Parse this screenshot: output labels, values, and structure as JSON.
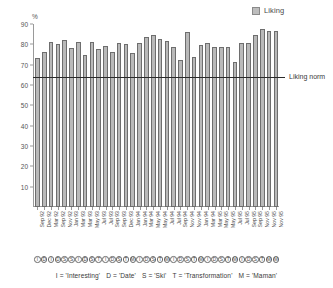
{
  "legend": {
    "items": [
      {
        "label": "Liking",
        "color": "#b9b9b9"
      }
    ]
  },
  "axis": {
    "unit_label": "%",
    "y_ticks": [
      "90",
      "80",
      "70",
      "60",
      "50",
      "40",
      "30",
      "20",
      "10"
    ]
  },
  "norm": {
    "label": "Liking norm",
    "value": 64
  },
  "footnote": {
    "items": [
      "I = 'Interesting'",
      "D = 'Date'",
      "S = 'Ski'",
      "T = 'Transformation'",
      "M = 'Maman'"
    ]
  },
  "chart_data": {
    "type": "bar",
    "title": "",
    "subtitle": "",
    "xlabel": "",
    "ylabel": "%",
    "ylim": [
      0,
      90
    ],
    "grid": false,
    "legend_position": "top-right",
    "series": [
      {
        "name": "Liking",
        "color": "#b9b9b9",
        "values": [
          73.5,
          76.0,
          81.0,
          80.0,
          82.0,
          78.0,
          81.0,
          74.8,
          81.0,
          77.8,
          79.0,
          76.0,
          80.8,
          80.0,
          75.8,
          80.8,
          83.5,
          84.5,
          82.5,
          81.5,
          78.8,
          72.5,
          86.0,
          73.8,
          79.8,
          80.6,
          78.6,
          78.6,
          78.6,
          71.5,
          80.5,
          80.6,
          84.5,
          87.5,
          86.6,
          86.6
        ]
      }
    ],
    "categories": [
      "Sep 92",
      "Dec 92",
      "Mar 92",
      "Sep 92",
      "Nov 92",
      "Jan 93",
      "Mar 93",
      "Mar 93",
      "May 93",
      "Jul 93",
      "Jul 93",
      "Sep 93",
      "Sep 93",
      "Dec 93",
      "Jan 94",
      "Jan 94",
      "Mar 94",
      "May 94",
      "May 94",
      "Jul 94",
      "Jul 94",
      "Sep 94",
      "Nov 94",
      "Nov 94",
      "Jan 94",
      "Mar 94",
      "Mar 95",
      "May 95",
      "May 95",
      "Jul 95",
      "Jul 95",
      "Sep 95",
      "Sep 95",
      "Nov 95",
      "Nov 95",
      "Nov 95"
    ],
    "category_codes": [
      "I",
      "D",
      "I",
      "D",
      "S",
      "S",
      "I",
      "D",
      "S",
      "T",
      "I",
      "D",
      "S",
      "T",
      "M",
      "I",
      "D",
      "S",
      "T",
      "M",
      "I",
      "D",
      "S",
      "T",
      "M",
      "I",
      "D",
      "S",
      "T",
      "M",
      "I",
      "D",
      "S",
      "T",
      "M",
      "M"
    ],
    "reference_lines": [
      {
        "label": "Liking norm",
        "value": 64,
        "color": "#2a2a2a"
      }
    ]
  }
}
